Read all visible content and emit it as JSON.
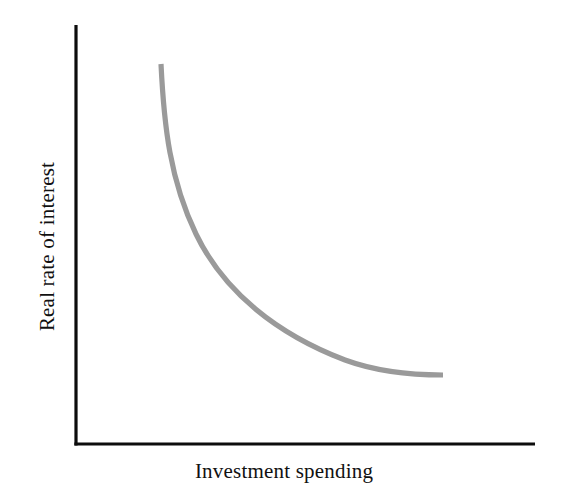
{
  "figure": {
    "background_color": "#ffffff",
    "width": 568,
    "height": 493
  },
  "axes": {
    "color": "#0d0d0d",
    "x_label": "Investment spending",
    "y_label": "Real rate of interest",
    "origin_x": 76,
    "origin_y": 444,
    "x_axis_end": 535,
    "y_axis_top": 25
  },
  "curve": {
    "color": "#9a9a9a",
    "stroke_width": 5.2,
    "path": "M 161 64 C 164 126 170 180 196 234 C 224 292 277 334 345 360 C 375 371 412 375 443 375"
  },
  "chart_data": {
    "type": "line",
    "title": "",
    "subtitle": "",
    "xlabel": "Investment spending",
    "ylabel": "Real rate of interest",
    "grid": false,
    "legend": "none",
    "axis_ticks": [],
    "annotations": [],
    "xlim": [
      0,
      100
    ],
    "ylim": [
      0,
      100
    ],
    "series": [
      {
        "name": "Investment demand",
        "color": "#9a9a9a",
        "x": [
          18.5,
          19.3,
          20.5,
          22.6,
          26.1,
          30.9,
          36.8,
          43.6,
          51.2,
          58.6,
          65.4,
          71.4,
          76.5,
          79.9,
          80.0
        ],
        "y": [
          90.7,
          84.0,
          77.2,
          70.5,
          63.8,
          57.2,
          50.8,
          44.8,
          39.2,
          34.3,
          30.3,
          27.1,
          25.0,
          23.8,
          23.5
        ]
      }
    ]
  }
}
